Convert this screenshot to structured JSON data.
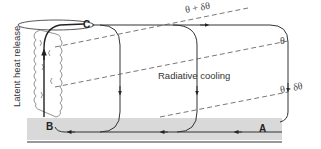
{
  "diagram": {
    "type": "atmospheric circulation schematic",
    "points": {
      "A": "A",
      "B": "B",
      "C": "C"
    },
    "isentropes": {
      "upper": "θ + δθ",
      "middle": "θ",
      "lower": "θ - δθ"
    },
    "labels": {
      "radiative_cooling": "Radiative cooling",
      "latent_heat_release": "Latent heat release"
    },
    "colors": {
      "line": "#333333",
      "surface_band": "#d9d9d9",
      "dashed": "#555555",
      "cloud_fill": "#ffffff"
    }
  }
}
